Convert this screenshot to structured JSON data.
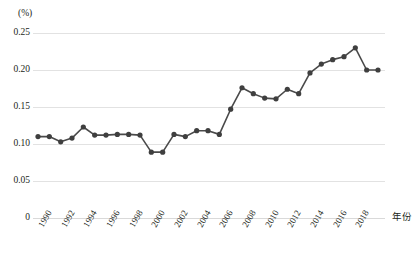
{
  "chart_data": {
    "type": "line",
    "title": "",
    "unit_label": "(%)",
    "xlabel": "年份",
    "ylabel": "",
    "ylim": [
      0,
      0.25
    ],
    "yticks": [
      "0",
      "0.05",
      "0.10",
      "0.15",
      "0.20",
      "0.25"
    ],
    "ytick_values": [
      0,
      0.05,
      0.1,
      0.15,
      0.2,
      0.25
    ],
    "grid": true,
    "legend": "none",
    "xtick_labels": [
      "1990",
      "1992",
      "1994",
      "1996",
      "1998",
      "2000",
      "2002",
      "2004",
      "2006",
      "2008",
      "2010",
      "2012",
      "2014",
      "2016",
      "2018"
    ],
    "x": [
      1990,
      1991,
      1992,
      1993,
      1994,
      1995,
      1996,
      1997,
      1998,
      1999,
      2000,
      2001,
      2002,
      2003,
      2004,
      2005,
      2006,
      2007,
      2008,
      2009,
      2010,
      2011,
      2012,
      2013,
      2014,
      2015,
      2016,
      2017,
      2018,
      2019,
      2020
    ],
    "categories": [
      "1990",
      "1991",
      "1992",
      "1993",
      "1994",
      "1995",
      "1996",
      "1997",
      "1998",
      "1999",
      "2000",
      "2001",
      "2002",
      "2003",
      "2004",
      "2005",
      "2006",
      "2007",
      "2008",
      "2009",
      "2010",
      "2011",
      "2012",
      "2013",
      "2014",
      "2015",
      "2016",
      "2017",
      "2018",
      "2019",
      "2020"
    ],
    "values": [
      0.11,
      0.11,
      0.103,
      0.108,
      0.123,
      0.112,
      0.112,
      0.113,
      0.113,
      0.112,
      0.089,
      0.089,
      0.113,
      0.11,
      0.118,
      0.118,
      0.113,
      0.147,
      0.176,
      0.168,
      0.162,
      0.161,
      0.174,
      0.168,
      0.196,
      0.208,
      0.214,
      0.218,
      0.23,
      0.2,
      0.2
    ],
    "series": [
      {
        "name": "比重",
        "values": [
          0.11,
          0.11,
          0.103,
          0.108,
          0.123,
          0.112,
          0.112,
          0.113,
          0.113,
          0.112,
          0.089,
          0.089,
          0.113,
          0.11,
          0.118,
          0.118,
          0.113,
          0.147,
          0.176,
          0.168,
          0.162,
          0.161,
          0.174,
          0.168,
          0.196,
          0.208,
          0.214,
          0.218,
          0.23,
          0.2,
          0.2
        ],
        "color": "#3f3f3f",
        "marker": "circle"
      }
    ]
  },
  "colors": {
    "line": "#3f3f3f",
    "grid": "#e2e2e2",
    "text": "#231f20",
    "background": "#ffffff"
  },
  "caption": {
    "text": ""
  }
}
